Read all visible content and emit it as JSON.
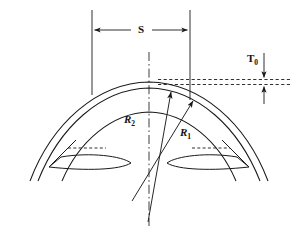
{
  "figure": {
    "kind": "engineering-cross-section-diagram",
    "background_color": "#ffffff",
    "line_color": "#1a1a1a",
    "width": 300,
    "height": 230
  },
  "labels": {
    "span": "S",
    "thickness_symbol": "T",
    "thickness_subscript": "0",
    "radius_outer_symbol": "R",
    "radius_outer_subscript": "2",
    "radius_inner_symbol": "R",
    "radius_inner_subscript": "1"
  },
  "geometry": {
    "centerline_x": 149,
    "span_left_x": 92,
    "span_right_x": 190,
    "span_dim_y": 30,
    "extension_top_y": 10,
    "thickness_line_upper_y": 79,
    "thickness_line_lower_y": 84,
    "thickness_line_left_x": 158,
    "thickness_line_right_x": 292,
    "outer_arc_apex_y": 82,
    "radii_origin_x": 148,
    "radii_origin_y": 222
  },
  "annotations": {
    "span_arrow": "double-headed horizontal dimension arrow",
    "thickness_arrows": "two vertical arrows pointing toward the pair of dashed lines",
    "radius_arrows": "arrowheads at the outer ends of the two radius leader lines"
  }
}
